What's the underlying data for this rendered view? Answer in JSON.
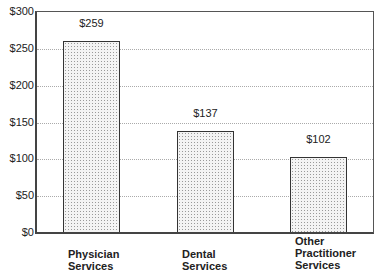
{
  "chart_data": {
    "type": "bar",
    "title": "",
    "xlabel": "",
    "ylabel": "",
    "categories": [
      "Physician Services",
      "Dental Services",
      "Other Practitioner Services"
    ],
    "category_lines": [
      [
        "Physician",
        "Services"
      ],
      [
        "Dental",
        "Services"
      ],
      [
        "Other",
        "Practitioner",
        "Services"
      ]
    ],
    "values": [
      259,
      137,
      102
    ],
    "value_labels": [
      "$259",
      "$137",
      "$102"
    ],
    "ylim": [
      0,
      300
    ],
    "yticks": [
      0,
      50,
      100,
      150,
      200,
      250,
      300
    ],
    "ytick_labels": [
      "$0",
      "$50",
      "$100",
      "$150",
      "$200",
      "$250",
      "$300"
    ],
    "grid": "horizontal dotted",
    "legend": "none",
    "bar_fill": "stippled light gray"
  }
}
